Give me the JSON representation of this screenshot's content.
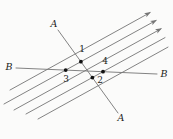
{
  "figure": {
    "width": 173,
    "height": 139,
    "background": "#fbfbfa",
    "line_color": "#757575",
    "label_color": "#1c1c1c",
    "dot_color": "#111111",
    "line_width": 0.9,
    "dot_radius": 1.9,
    "label_font_size": 9.5,
    "number_font_size": 9,
    "parallel_lines": [
      {
        "name": "parallel-line-1",
        "x1": 10,
        "y1": 90,
        "x2": 150,
        "y2": 12.6,
        "arrow": true
      },
      {
        "name": "parallel-line-2",
        "x1": 4,
        "y1": 104,
        "x2": 156,
        "y2": 20.4,
        "arrow": true
      },
      {
        "name": "parallel-line-3",
        "x1": 14,
        "y1": 110,
        "x2": 161,
        "y2": 28.8,
        "arrow": true
      },
      {
        "name": "parallel-line-4",
        "x1": 26,
        "y1": 114,
        "x2": 165,
        "y2": 37.6,
        "arrow": false
      },
      {
        "name": "parallel-line-5",
        "x1": 38,
        "y1": 119,
        "x2": 168,
        "y2": 47.1,
        "arrow": false
      }
    ],
    "transversal_a": {
      "name": "transversal-line-a",
      "x1": 58,
      "y1": 30,
      "x2": 118,
      "y2": 113
    },
    "line_b": {
      "name": "line-b",
      "x1": 16,
      "y1": 68,
      "x2": 157,
      "y2": 74
    },
    "points": [
      {
        "label": "1",
        "x": 80.9,
        "y": 61.7,
        "label_x": 82,
        "label_y": 49
      },
      {
        "label": "2",
        "x": 92.4,
        "y": 77.6,
        "label_x": 100,
        "label_y": 80
      },
      {
        "label": "3",
        "x": 65.7,
        "y": 70.1,
        "label_x": 66,
        "label_y": 79
      },
      {
        "label": "4",
        "x": 103,
        "y": 71.7,
        "label_x": 105,
        "label_y": 61
      }
    ],
    "line_labels": [
      {
        "id": "label-a-top",
        "text": "A",
        "x": 54,
        "y": 23
      },
      {
        "id": "label-a-bottom",
        "text": "A",
        "x": 121,
        "y": 117
      },
      {
        "id": "label-b-left",
        "text": "B",
        "x": 9,
        "y": 66
      },
      {
        "id": "label-b-right",
        "text": "B",
        "x": 164,
        "y": 73
      }
    ]
  }
}
